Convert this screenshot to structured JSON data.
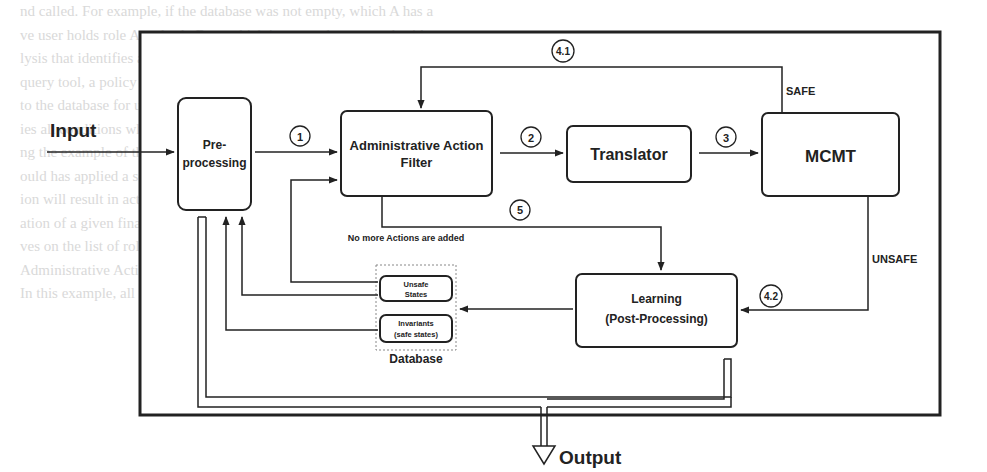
{
  "diagram": {
    "colors": {
      "stroke": "#222222",
      "background": "#ffffff",
      "faded_text": "#d9d9d9",
      "database_border": "#888888"
    },
    "io": {
      "input_label": "Input",
      "output_label": "Output"
    },
    "nodes": {
      "preprocessing": {
        "line1": "Pre-",
        "line2": "processing"
      },
      "admin_filter": {
        "line1": "Administrative Action",
        "line2": "Filter"
      },
      "translator": {
        "label": "Translator"
      },
      "mcmt": {
        "label": "MCMT"
      },
      "learning": {
        "line1": "Learning",
        "line2": "(Post-Processing)"
      },
      "database": {
        "label": "Database",
        "unsafe_states": {
          "line1": "Unsafe",
          "line2": "States"
        },
        "invariants": {
          "line1": "Invariants",
          "line2": "(safe states)"
        }
      }
    },
    "steps": {
      "s1": "1",
      "s2": "2",
      "s3": "3",
      "s41": "4.1",
      "s42": "4.2",
      "s5": "5"
    },
    "edge_labels": {
      "safe": "SAFE",
      "unsafe": "UNSAFE",
      "no_more_actions": "No more Actions are added"
    }
  },
  "background_text": [
    "nd called. For example, if the database was not empty, which A has a",
    "ve user holds role A and role B, to which is mapped an example sith",
    "lysis that identifies a regression from the initial state of the query. When",
    "query tool, a policy can be described by a set of links. As we will find",
    "to the database for using UP sets that are inherent properties of the system",
    "ies all conditions which are then from the initial state to the query of",
    "ng the example of that identify what whole administrative user; if at",
    "ould has applied a sequence of the actions. A safe state means that",
    "ion will result in action, if so if all conditions admin needed to the",
    "ation of a given final action and return to the safety the problem with",
    "ves on the list of role.",
    "",
    "",
    "",
    "Administrative Actions",
    "",
    "In this example, all the states, roles and role conditions, it is in"
  ]
}
